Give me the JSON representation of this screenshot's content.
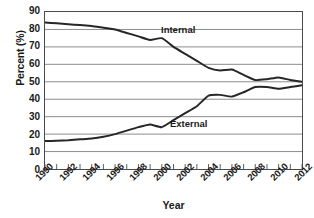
{
  "chart_data": {
    "type": "line",
    "title": "",
    "xlabel": "Year",
    "ylabel": "Percent (%)",
    "xlim": [
      1990,
      2012
    ],
    "ylim": [
      0,
      90
    ],
    "ytick_step": 10,
    "xtick_step": 1,
    "xtick_label_step": 2,
    "grid": "horizontal",
    "legend": "inline-annotations",
    "ytick_labels": [
      "90",
      "80",
      "70",
      "60",
      "50",
      "40",
      "30",
      "20",
      "10",
      "0"
    ],
    "ytick_values": [
      90,
      80,
      70,
      60,
      50,
      40,
      30,
      20,
      10,
      0
    ],
    "xtick_labels": [
      "1990",
      "1992",
      "1994",
      "1996",
      "1998",
      "2000",
      "2002",
      "2004",
      "2006",
      "2008",
      "2010",
      "2012"
    ],
    "xtick_values": [
      1990,
      1992,
      1994,
      1996,
      1998,
      2000,
      2002,
      2004,
      2006,
      2008,
      2010,
      2012
    ],
    "x": [
      1990,
      1991,
      1992,
      1993,
      1994,
      1995,
      1996,
      1997,
      1998,
      1999,
      2000,
      2001,
      2002,
      2003,
      2004,
      2005,
      2006,
      2007,
      2008,
      2009,
      2010,
      2011,
      2012
    ],
    "series": [
      {
        "name": "Internal",
        "color": "#262626",
        "values": [
          84,
          83.5,
          83,
          82.5,
          82,
          81,
          80,
          78,
          76,
          74,
          75,
          70,
          66,
          62,
          58,
          56.5,
          57,
          54,
          51,
          51.5,
          52.5,
          51,
          50
        ]
      },
      {
        "name": "External",
        "color": "#262626",
        "values": [
          16,
          16.2,
          16.5,
          17,
          17.5,
          18.5,
          20,
          22,
          24,
          25.5,
          24,
          28,
          32,
          36,
          42,
          42.5,
          41.5,
          44,
          47,
          47,
          46,
          47,
          48
        ]
      }
    ],
    "annotations": [
      {
        "text": "Internal",
        "x": 2001,
        "y": 76
      },
      {
        "text": "External",
        "x": 2002,
        "y": 27
      }
    ]
  },
  "axis": {
    "y_title": "Percent (%)",
    "x_title": "Year"
  }
}
